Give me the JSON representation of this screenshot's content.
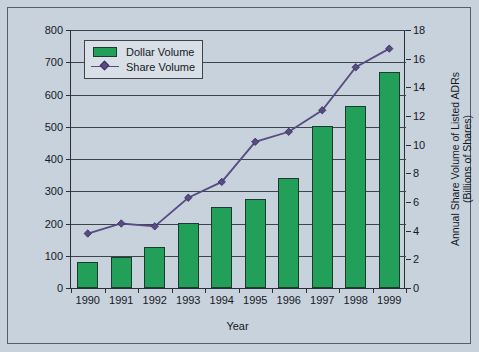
{
  "chart_data": {
    "type": "bar",
    "title": "",
    "xlabel": "Year",
    "categories": [
      "1990",
      "1991",
      "1992",
      "1993",
      "1994",
      "1995",
      "1996",
      "1997",
      "1998",
      "1999"
    ],
    "grid": true,
    "legend_position": "top-left",
    "axes": {
      "left": {
        "label": "Annual Dollar Volume of Listed ADRs (US$ in Billions)",
        "ticks": [
          0,
          100,
          200,
          300,
          400,
          500,
          600,
          700,
          800
        ],
        "ylim": [
          0,
          800
        ]
      },
      "right": {
        "label_line1": "Annual Share Volume of Listed ADRs",
        "label_line2": "(Billions of Shares)",
        "ticks": [
          0,
          2,
          4,
          6,
          8,
          10,
          12,
          14,
          16,
          18
        ],
        "ylim": [
          0,
          18
        ]
      }
    },
    "series": [
      {
        "name": "Dollar Volume",
        "kind": "bar",
        "axis": "left",
        "color": "#22a05a",
        "values": [
          80,
          96,
          126,
          201,
          250,
          277,
          341,
          501,
          564,
          669
        ]
      },
      {
        "name": "Share Volume",
        "kind": "line",
        "axis": "right",
        "color": "#584a82",
        "marker": "diamond",
        "values": [
          3.8,
          4.5,
          4.3,
          6.3,
          7.4,
          10.2,
          10.9,
          12.4,
          15.4,
          16.7
        ]
      }
    ]
  },
  "legend": {
    "items": [
      {
        "label": "Dollar Volume",
        "swatch": "green-box-swatch"
      },
      {
        "label": "Share Volume",
        "swatch": "purple-diamond-line-swatch"
      }
    ]
  },
  "colors": {
    "background": "#c8d2dd",
    "bar": "#22a05a",
    "bar_outline": "#1b3b2c",
    "line": "#584a82",
    "marker": "#5a4a85",
    "axis": "#2a2f36",
    "grid": "#3d444c",
    "text": "#15191e",
    "frame": "#555f6b",
    "legend_background": "#d8dfe7"
  }
}
